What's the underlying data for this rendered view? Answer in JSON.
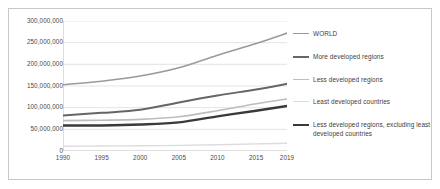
{
  "chart_data": {
    "type": "line",
    "title": "",
    "subtitle": "",
    "xlabel": "",
    "ylabel": "",
    "x": [
      1990,
      1995,
      2000,
      2005,
      2010,
      2015,
      2019
    ],
    "xtick_labels": [
      "1990",
      "1995",
      "2000",
      "2005",
      "2010",
      "2015",
      "2019"
    ],
    "ytick_labels": [
      "0",
      "50,000,000",
      "100,000,000",
      "150,000,000",
      "200,000,000",
      "250,000,000",
      "300,000,000"
    ],
    "ytick_values": [
      0,
      50000000,
      100000000,
      150000000,
      200000000,
      250000000,
      300000000
    ],
    "ylim": [
      0,
      300000000
    ],
    "grid": "horizontal",
    "legend_position": "right",
    "series": [
      {
        "name": "WORLD",
        "color": "#9a9a9a",
        "width": 1.6,
        "values": [
          153000000,
          161000000,
          173000000,
          192000000,
          221000000,
          248000000,
          272000000
        ]
      },
      {
        "name": "More developed regions",
        "color": "#666666",
        "width": 2.0,
        "values": [
          82000000,
          88000000,
          95000000,
          112000000,
          128000000,
          142000000,
          155000000
        ]
      },
      {
        "name": "Less developed regions",
        "color": "#bdbdbd",
        "width": 1.6,
        "values": [
          70000000,
          71000000,
          73000000,
          79000000,
          93000000,
          109000000,
          120000000
        ]
      },
      {
        "name": "Least developed countries",
        "color": "#dcdcdc",
        "width": 1.4,
        "values": [
          11000000,
          11500000,
          12000000,
          13000000,
          14500000,
          16500000,
          18000000
        ]
      },
      {
        "name": "Less developed regions, excluding least developed countries",
        "color": "#3a3a3a",
        "width": 2.4,
        "values": [
          59000000,
          59000000,
          61000000,
          66000000,
          80000000,
          93000000,
          104000000
        ]
      }
    ]
  },
  "legend": {
    "items": [
      {
        "label": "WORLD"
      },
      {
        "label": "More developed regions"
      },
      {
        "label": "Less developed regions"
      },
      {
        "label": "Least developed countries"
      },
      {
        "label": "Less developed regions, excluding least developed countries"
      }
    ]
  },
  "colors": {
    "frame_border": "#c8c8c8",
    "gridline": "#d9d9d9",
    "axis_line": "#b5b5b5",
    "tick_text": "#4a4a4a",
    "legend_text": "#3d3d3d",
    "background": "#ffffff"
  }
}
